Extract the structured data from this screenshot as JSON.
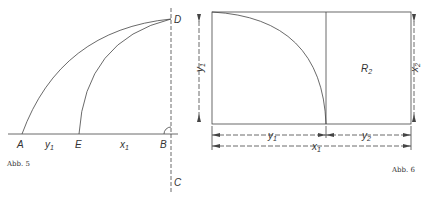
{
  "figures": [
    {
      "caption": "Abb. 5",
      "points": {
        "A": "A",
        "B": "B",
        "C": "C",
        "D": "D",
        "E": "E"
      },
      "segment_labels": {
        "AE": "y",
        "AE_sub": "1",
        "EB": "x",
        "EB_sub": "1"
      }
    },
    {
      "caption": "Abb. 6",
      "region_label": "R",
      "region_sub": "2",
      "dims": {
        "left": "y",
        "left_sub": "1",
        "right": "x",
        "right_sub": "2",
        "bottom1": "y",
        "bottom1_sub": "1",
        "bottom2": "y",
        "bottom2_sub": "2",
        "bottom_total": "x",
        "bottom_total_sub": "1"
      }
    }
  ]
}
